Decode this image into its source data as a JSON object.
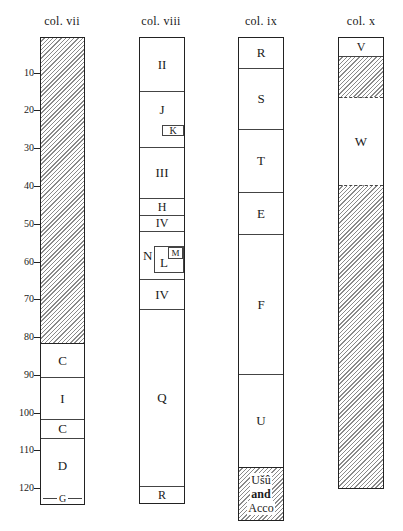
{
  "axis": {
    "ticks": [
      "10",
      "20",
      "30",
      "40",
      "50",
      "60",
      "70",
      "80",
      "90",
      "100",
      "110",
      "120"
    ]
  },
  "columns": [
    {
      "title": "col. vii",
      "segments": [
        {
          "label": "",
          "from": 0,
          "to": 81.5,
          "hatched": true
        },
        {
          "label": "C",
          "from": 81.5,
          "to": 90.5
        },
        {
          "label": "I",
          "from": 90.5,
          "to": 101.5
        },
        {
          "label": "C",
          "from": 101.5,
          "to": 106.5
        },
        {
          "label": "D",
          "from": 106.5,
          "to": 124
        },
        {
          "label": "G",
          "from": 122.5,
          "to": 124,
          "note": "thin band"
        }
      ]
    },
    {
      "title": "col. viii",
      "segments": [
        {
          "label": "II",
          "from": 0,
          "to": 14
        },
        {
          "label": "J",
          "from": 14,
          "to": 29,
          "inset": "K"
        },
        {
          "label": "III",
          "from": 29,
          "to": 42.5
        },
        {
          "label": "H",
          "from": 42.5,
          "to": 47
        },
        {
          "label": "IV",
          "from": 47,
          "to": 51.5
        },
        {
          "label": "N",
          "from": 51.5,
          "to": 64,
          "inset": "L",
          "inset_inner": "M"
        },
        {
          "label": "IV",
          "from": 64,
          "to": 72
        },
        {
          "label": "Q",
          "from": 72,
          "to": 119
        },
        {
          "label": "R",
          "from": 119,
          "to": 124
        }
      ]
    },
    {
      "title": "col. ix",
      "segments": [
        {
          "label": "R",
          "from": 0,
          "to": 8
        },
        {
          "label": "S",
          "from": 8,
          "to": 24
        },
        {
          "label": "T",
          "from": 24,
          "to": 41
        },
        {
          "label": "E",
          "from": 41,
          "to": 52
        },
        {
          "label": "F",
          "from": 52,
          "to": 89
        },
        {
          "label": "U",
          "from": 89,
          "to": 114
        },
        {
          "label": "Ušû and Acco",
          "from": 114,
          "to": 128,
          "hatched": true,
          "lines": [
            "Ušû",
            "and",
            "Acco"
          ]
        }
      ]
    },
    {
      "title": "col. x",
      "segments": [
        {
          "label": "V",
          "from": 0,
          "to": 5
        },
        {
          "label": "",
          "from": 5,
          "to": 16,
          "hatched": true
        },
        {
          "label": "W",
          "from": 16,
          "to": 39
        },
        {
          "label": "",
          "from": 39,
          "to": 119.5,
          "hatched": true
        }
      ]
    }
  ],
  "labels": {
    "vii": {
      "title": "col. vii",
      "C1": "C",
      "I": "I",
      "C2": "C",
      "D": "D",
      "G": "G"
    },
    "viii": {
      "title": "col. viii",
      "II": "II",
      "J": "J",
      "K": "K",
      "III": "III",
      "H": "H",
      "IV1": "IV",
      "N": "N",
      "L": "L",
      "M": "M",
      "IV2": "IV",
      "Q": "Q",
      "R": "R"
    },
    "ix": {
      "title": "col. ix",
      "R": "R",
      "S": "S",
      "T": "T",
      "E": "E",
      "F": "F",
      "U": "U",
      "usu1": "Ušû",
      "usu2": "and",
      "usu3": "Acco"
    },
    "x": {
      "title": "col. x",
      "V": "V",
      "W": "W"
    }
  }
}
